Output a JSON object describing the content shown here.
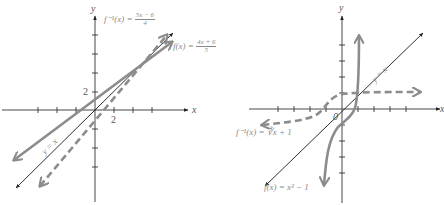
{
  "figure": {
    "colors": {
      "axis": "#3a3a3a",
      "identity_line": "#1a1a1a",
      "function_curve": "#8c8c8c",
      "inverse_curve": "#8c8c8c",
      "text": "#8a8a8a"
    },
    "left_graph": {
      "title": "Linear function and its inverse",
      "axis_labels": {
        "x": "x",
        "y": "y"
      },
      "tick_labels": {
        "y_2": "2",
        "x_2": "2"
      },
      "curves": {
        "f": {
          "label_prefix": "f(x) = ",
          "numerator": "4x + 6",
          "denominator": "5",
          "style": "solid"
        },
        "f_inv": {
          "label_prefix": "f⁻¹(x) = ",
          "numerator": "5x − 6",
          "denominator": "4",
          "style": "dashed"
        },
        "identity": {
          "label": "y = x",
          "style": "thin-solid"
        }
      }
    },
    "right_graph": {
      "title": "Cubic function and its inverse",
      "axis_labels": {
        "x": "x",
        "y": "y"
      },
      "tick_labels": {
        "origin": "0"
      },
      "curves": {
        "f": {
          "label": "f(x) = x³ − 1",
          "style": "solid"
        },
        "f_inv": {
          "label": "f⁻¹(x) = ∛x + 1",
          "style": "dashed"
        },
        "identity": {
          "label": "y = x",
          "style": "thin-solid"
        }
      }
    }
  }
}
